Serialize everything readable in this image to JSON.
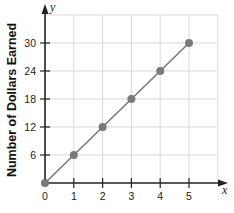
{
  "chart_data": {
    "type": "line",
    "title": "",
    "xlabel": "",
    "ylabel": "Number of Dollars Earned",
    "x_axis_name": "x",
    "y_axis_name": "y",
    "x": [
      0,
      1,
      2,
      3,
      4,
      5
    ],
    "series": [
      {
        "name": "Dollars Earned",
        "values": [
          0,
          6,
          12,
          18,
          24,
          30
        ],
        "markers": true
      }
    ],
    "xticks": [
      "0",
      "1",
      "2",
      "3",
      "4",
      "5"
    ],
    "yticks": [
      "6",
      "12",
      "18",
      "24",
      "30"
    ],
    "xlim": [
      0,
      6
    ],
    "ylim": [
      0,
      36
    ],
    "grid": true,
    "legend": null
  },
  "colors": {
    "grid": "#d9d9d9",
    "axis": "#222222",
    "series": "#7a7a7a"
  }
}
